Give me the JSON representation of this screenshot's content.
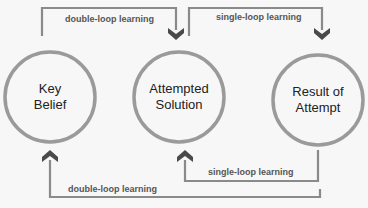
{
  "diagram": {
    "colors": {
      "background": "#f7f7f7",
      "circle_stroke": "#9a9a9a",
      "connector": "#8a8a8a",
      "arrowhead": "#4a4a4a",
      "node_text": "#222222",
      "edge_text": "#555555"
    },
    "nodes": [
      {
        "id": "key-belief",
        "lines": [
          "Key",
          "Belief"
        ]
      },
      {
        "id": "attempted-solution",
        "lines": [
          "Attempted",
          "Solution"
        ]
      },
      {
        "id": "result-of-attempt",
        "lines": [
          "Result of",
          "Attempt"
        ]
      }
    ],
    "edges": [
      {
        "from": "key-belief",
        "to": "attempted-solution",
        "label": "double-loop learning",
        "position": "top"
      },
      {
        "from": "attempted-solution",
        "to": "result-of-attempt",
        "label": "single-loop learning",
        "position": "top"
      },
      {
        "from": "result-of-attempt",
        "to": "attempted-solution",
        "label": "single-loop learning",
        "position": "bottom"
      },
      {
        "from": "result-of-attempt",
        "to": "key-belief",
        "label": "double-loop learning",
        "position": "bottom"
      }
    ]
  }
}
